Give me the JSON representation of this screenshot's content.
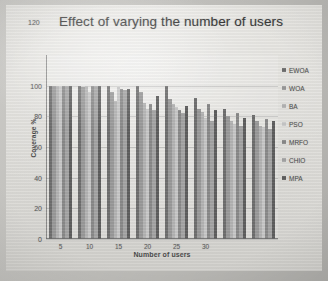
{
  "chart_data": {
    "type": "bar",
    "title": "Effect of varying the number of users",
    "xlabel": "Number of users",
    "ylabel": "Coverage %",
    "categories": [
      "5",
      "10",
      "15",
      "20",
      "25",
      "30",
      "35",
      "40"
    ],
    "xtick_labels": [
      "5",
      "10",
      "15",
      "20",
      "25",
      "30"
    ],
    "ytick_labels": [
      "0",
      "20",
      "40",
      "60",
      "80",
      "100",
      "120"
    ],
    "yticks": [
      0,
      20,
      40,
      60,
      80,
      100,
      120
    ],
    "ylim": [
      0,
      120
    ],
    "grid": true,
    "legend_position": "right",
    "series": [
      {
        "name": "EWOA",
        "color": "#6f6f6f",
        "values": [
          100,
          100,
          100,
          100,
          100,
          92,
          85,
          81
        ]
      },
      {
        "name": "WOA",
        "color": "#9a9a9a",
        "values": [
          100,
          99,
          96,
          96,
          91,
          85,
          80,
          77
        ]
      },
      {
        "name": "BA",
        "color": "#b4b4b4",
        "values": [
          100,
          100,
          90,
          89,
          88,
          83,
          77,
          74
        ]
      },
      {
        "name": "PSO",
        "color": "#c8c8c8",
        "values": [
          100,
          96,
          99,
          85,
          86,
          79,
          75,
          73
        ]
      },
      {
        "name": "MRFO",
        "color": "#8a8a8a",
        "values": [
          100,
          100,
          98,
          88,
          84,
          88,
          82,
          78
        ]
      },
      {
        "name": "CHIO",
        "color": "#a5a5a5",
        "values": [
          100,
          100,
          97,
          84,
          82,
          77,
          74,
          72
        ]
      },
      {
        "name": "MPA",
        "color": "#5e5e5e",
        "values": [
          100,
          100,
          98,
          93,
          87,
          84,
          79,
          77
        ]
      }
    ]
  },
  "legend": {
    "items": [
      {
        "label": "EWOA"
      },
      {
        "label": "WOA"
      },
      {
        "label": "BA"
      },
      {
        "label": "PSO"
      },
      {
        "label": "MRFO"
      },
      {
        "label": "CHIO"
      },
      {
        "label": "MPA"
      }
    ]
  }
}
